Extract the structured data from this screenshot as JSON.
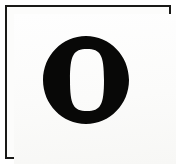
{
  "document": {
    "kind": "letter-specimen",
    "page_background": "#ffffff",
    "paper_tone": "#fcfcfb"
  },
  "frame": {
    "name": "specimen-border",
    "color": "#191917",
    "stroke_width_px": 2,
    "x": 5,
    "y": 5,
    "width": 166,
    "height": 154
  },
  "glyph": {
    "character": "O",
    "label": "Capital letter O",
    "style": "bold didone serif",
    "color": "#080807",
    "outer": {
      "center_x": 86,
      "center_y": 80,
      "radius_x": 43,
      "radius_y": 44
    },
    "counter": {
      "center_x": 87,
      "center_y": 80,
      "radius_x": 17,
      "radius_y": 31,
      "color": "#fcfcfb"
    },
    "stroke_thick_px": 26,
    "stroke_thin_px": 12
  },
  "caption": {
    "text": "O"
  }
}
